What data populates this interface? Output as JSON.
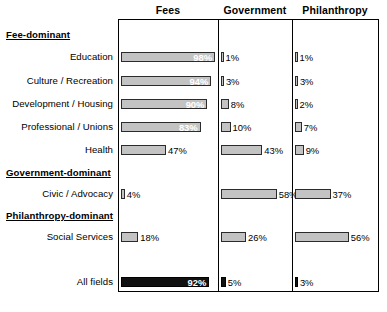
{
  "chart_data": {
    "type": "bar",
    "title": "",
    "subtitle": "",
    "xlabel": "",
    "ylabel": "",
    "orientation": "horizontal",
    "grid": false,
    "legend_position": "top-as-column-headers",
    "axis_range_percent": [
      0,
      100
    ],
    "value_suffix": "%",
    "series": [
      {
        "name": "Fees",
        "values": [
          98,
          94,
          90,
          83,
          47,
          4,
          18,
          92
        ]
      },
      {
        "name": "Government",
        "values": [
          1,
          3,
          8,
          10,
          43,
          58,
          26,
          5
        ]
      },
      {
        "name": "Philanthropy",
        "values": [
          1,
          3,
          2,
          7,
          9,
          37,
          56,
          3
        ]
      }
    ],
    "categories": [
      "Education",
      "Culture / Recreation",
      "Development / Housing",
      "Professional / Unions",
      "Health",
      "Civic / Advocacy",
      "Social Services",
      "All fields"
    ],
    "groups": [
      {
        "label": "Fee-dominant",
        "categories": [
          "Education",
          "Culture / Recreation",
          "Development / Housing",
          "Professional / Unions",
          "Health"
        ]
      },
      {
        "label": "Government-dominant",
        "categories": [
          "Civic / Advocacy"
        ]
      },
      {
        "label": "Philanthropy-dominant",
        "categories": [
          "Social Services"
        ]
      },
      {
        "label": "",
        "categories": [
          "All fields"
        ]
      }
    ]
  },
  "columns": [
    {
      "label": "Fees"
    },
    {
      "label": "Government"
    },
    {
      "label": "Philanthropy"
    }
  ],
  "sections": [
    {
      "label": "Fee-dominant"
    },
    {
      "label": "Government-dominant"
    },
    {
      "label": "Philanthropy-dominant"
    }
  ],
  "rows": [
    {
      "label": "Education",
      "cells": [
        {
          "text": "98%",
          "value": 98,
          "style": "light",
          "placement": "inside"
        },
        {
          "text": "1%",
          "value": 1,
          "style": "light",
          "placement": "outside"
        },
        {
          "text": "1%",
          "value": 1,
          "style": "light",
          "placement": "outside"
        }
      ]
    },
    {
      "label": "Culture / Recreation",
      "cells": [
        {
          "text": "94%",
          "value": 94,
          "style": "light",
          "placement": "inside"
        },
        {
          "text": "3%",
          "value": 3,
          "style": "light",
          "placement": "outside"
        },
        {
          "text": "3%",
          "value": 3,
          "style": "light",
          "placement": "outside"
        }
      ]
    },
    {
      "label": "Development / Housing",
      "cells": [
        {
          "text": "90%",
          "value": 90,
          "style": "light",
          "placement": "inside"
        },
        {
          "text": "8%",
          "value": 8,
          "style": "light",
          "placement": "outside"
        },
        {
          "text": "2%",
          "value": 2,
          "style": "light",
          "placement": "outside"
        }
      ]
    },
    {
      "label": "Professional / Unions",
      "cells": [
        {
          "text": "83%",
          "value": 83,
          "style": "light",
          "placement": "inside"
        },
        {
          "text": "10%",
          "value": 10,
          "style": "light",
          "placement": "outside"
        },
        {
          "text": "7%",
          "value": 7,
          "style": "light",
          "placement": "outside"
        }
      ]
    },
    {
      "label": "Health",
      "cells": [
        {
          "text": "47%",
          "value": 47,
          "style": "light",
          "placement": "outside"
        },
        {
          "text": "43%",
          "value": 43,
          "style": "light",
          "placement": "outside"
        },
        {
          "text": "9%",
          "value": 9,
          "style": "light",
          "placement": "outside"
        }
      ]
    },
    {
      "label": "Civic / Advocacy",
      "cells": [
        {
          "text": "4%",
          "value": 4,
          "style": "light",
          "placement": "outside"
        },
        {
          "text": "58%",
          "value": 58,
          "style": "light",
          "placement": "outside"
        },
        {
          "text": "37%",
          "value": 37,
          "style": "light",
          "placement": "outside"
        }
      ]
    },
    {
      "label": "Social Services",
      "cells": [
        {
          "text": "18%",
          "value": 18,
          "style": "light",
          "placement": "outside"
        },
        {
          "text": "26%",
          "value": 26,
          "style": "light",
          "placement": "outside"
        },
        {
          "text": "56%",
          "value": 56,
          "style": "light",
          "placement": "outside"
        }
      ]
    },
    {
      "label": "All fields",
      "cells": [
        {
          "text": "92%",
          "value": 92,
          "style": "dark",
          "placement": "inside"
        },
        {
          "text": "5%",
          "value": 5,
          "style": "dark",
          "placement": "outside"
        },
        {
          "text": "3%",
          "value": 3,
          "style": "dark",
          "placement": "outside"
        }
      ]
    }
  ],
  "colors": {
    "bar_light_fill": "#c3c3c3",
    "bar_light_border": "#2b2b2b",
    "bar_dark_fill": "#111111",
    "bar_dark_border": "#000000",
    "frame": "#000000",
    "background": "#ffffff",
    "text": "#000000",
    "inside_label_text": "#ffffff"
  },
  "layout": {
    "plot_left": 118,
    "plot_top": 19,
    "plot_width": 261,
    "plot_height": 273,
    "column_starts": [
      121,
      221,
      295
    ],
    "column_scale_px_per_percent": 0.96,
    "divider_x": [
      218,
      292
    ],
    "row_y": [
      52,
      76,
      99,
      122,
      145,
      189,
      232,
      277
    ],
    "section_y": [
      29,
      167,
      210
    ],
    "header_y": 4,
    "header_centers": [
      168,
      255,
      335
    ]
  }
}
